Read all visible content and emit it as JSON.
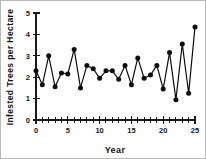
{
  "chart_data": {
    "type": "line",
    "title": "",
    "xlabel": "Year",
    "ylabel": "Infested Trees per Hectare",
    "xlim": [
      0,
      25
    ],
    "ylim": [
      0,
      5
    ],
    "grid": false,
    "legend": null,
    "marker": "filled-circle",
    "line_color": "#0d0d0d",
    "marker_color": "#0d0d0d",
    "x_major_ticks": [
      0,
      5,
      10,
      15,
      20,
      25
    ],
    "x_major_tick_labels": [
      "0",
      "5",
      "10",
      "15",
      "20",
      "25"
    ],
    "x_minor_tick_step": 1,
    "y_major_ticks": [
      0,
      1,
      2,
      3,
      4,
      5
    ],
    "y_major_tick_labels": [
      "0",
      "1",
      "2",
      "3",
      "4",
      "5"
    ],
    "x": [
      0,
      1,
      2,
      3,
      4,
      5,
      6,
      7,
      8,
      9,
      10,
      11,
      12,
      13,
      14,
      15,
      16,
      17,
      18,
      19,
      20,
      21,
      22,
      23,
      24,
      25
    ],
    "values": [
      2.3,
      1.65,
      3.0,
      1.55,
      2.2,
      2.15,
      3.3,
      1.5,
      2.55,
      2.4,
      1.95,
      2.3,
      2.3,
      1.9,
      2.55,
      1.65,
      2.9,
      1.95,
      2.1,
      2.55,
      1.45,
      3.15,
      0.95,
      3.55,
      1.25,
      4.35
    ],
    "series": [
      {
        "name": "Infested trees per hectare",
        "values": [
          2.3,
          1.65,
          3.0,
          1.55,
          2.2,
          2.15,
          3.3,
          1.5,
          2.55,
          2.4,
          1.95,
          2.3,
          2.3,
          1.9,
          2.55,
          1.65,
          2.9,
          1.95,
          2.1,
          2.55,
          1.45,
          3.15,
          0.95,
          3.55,
          1.25,
          4.35
        ]
      }
    ]
  },
  "axis": {
    "x_title": "Year",
    "y_title": "Infested Trees per Hectare"
  }
}
